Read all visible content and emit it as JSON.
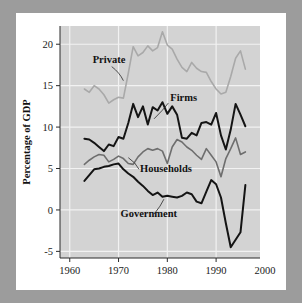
{
  "figure": {
    "background_color": "#ffffff",
    "page_color": "#9c9c9c",
    "plot_background_color": "#d3d3d3",
    "gridline_color": "#f2f2f2"
  },
  "chart_data": {
    "type": "line",
    "title": "",
    "subtitle": "",
    "xlabel": "",
    "ylabel": "Percentage of GDP",
    "xlim": [
      1958,
      1999
    ],
    "ylim": [
      -5.8,
      22.2
    ],
    "xticks": [
      1960,
      1970,
      1980,
      1990,
      2000
    ],
    "xtick_labels": [
      "1960",
      "1970",
      "1980",
      "1990",
      "2000"
    ],
    "yticks": [
      20,
      15,
      10,
      5,
      0,
      -5
    ],
    "ytick_labels": [
      "20",
      "15",
      "10",
      "5",
      "0",
      "-5"
    ],
    "grid": true,
    "grid_axes": "both",
    "legend": "inline-annotations",
    "legend_position": "in-plot leader-line labels",
    "series": [
      {
        "name": "Private",
        "color": "#a9a9a9",
        "line_width": 1.6,
        "label_text": "Private",
        "x": [
          1963,
          1964,
          1965,
          1966,
          1967,
          1968,
          1969,
          1970,
          1971,
          1972,
          1973,
          1974,
          1975,
          1976,
          1977,
          1978,
          1979,
          1980,
          1981,
          1982,
          1983,
          1984,
          1985,
          1986,
          1987,
          1988,
          1989,
          1990,
          1991,
          1992,
          1993,
          1994,
          1995,
          1996
        ],
        "values": [
          14.6,
          14.2,
          15.0,
          14.6,
          13.9,
          12.9,
          13.3,
          13.6,
          13.5,
          16.5,
          19.7,
          18.6,
          19.0,
          19.8,
          19.2,
          19.6,
          21.5,
          19.9,
          19.4,
          18.2,
          17.2,
          16.7,
          17.8,
          17.1,
          16.7,
          16.6,
          15.5,
          14.6,
          14.0,
          14.2,
          16.1,
          18.3,
          19.2,
          17.0
        ]
      },
      {
        "name": "Firms",
        "color": "#141414",
        "line_width": 2.0,
        "label_text": "Firms",
        "x": [
          1963,
          1964,
          1965,
          1966,
          1967,
          1968,
          1969,
          1970,
          1971,
          1972,
          1973,
          1974,
          1975,
          1976,
          1977,
          1978,
          1979,
          1980,
          1981,
          1982,
          1983,
          1984,
          1985,
          1986,
          1987,
          1988,
          1989,
          1990,
          1991,
          1992,
          1993,
          1994,
          1995,
          1996
        ],
        "values": [
          8.6,
          8.5,
          8.1,
          7.6,
          7.1,
          7.9,
          7.7,
          8.8,
          8.6,
          10.5,
          12.8,
          11.2,
          12.5,
          10.3,
          12.4,
          12.0,
          13.0,
          11.6,
          12.5,
          11.5,
          8.7,
          8.6,
          9.3,
          9.0,
          10.5,
          10.6,
          10.3,
          11.7,
          9.0,
          7.3,
          9.7,
          12.8,
          11.5,
          10.1
        ]
      },
      {
        "name": "Households",
        "color": "#6e6e6e",
        "line_width": 1.6,
        "label_text": "Households",
        "x": [
          1963,
          1964,
          1965,
          1966,
          1967,
          1968,
          1969,
          1970,
          1971,
          1972,
          1973,
          1974,
          1975,
          1976,
          1977,
          1978,
          1979,
          1980,
          1981,
          1982,
          1983,
          1984,
          1985,
          1986,
          1987,
          1988,
          1989,
          1990,
          1991,
          1992,
          1993,
          1994,
          1995,
          1996
        ],
        "values": [
          5.5,
          6.0,
          6.4,
          6.7,
          6.6,
          5.8,
          6.1,
          6.5,
          6.2,
          5.6,
          5.5,
          6.4,
          7.0,
          7.4,
          7.2,
          7.4,
          7.1,
          5.6,
          7.6,
          8.5,
          8.2,
          7.6,
          7.2,
          6.6,
          6.1,
          7.4,
          6.6,
          5.8,
          4.0,
          6.2,
          7.4,
          8.7,
          6.7,
          7.0
        ]
      },
      {
        "name": "Government",
        "color": "#141414",
        "line_width": 2.0,
        "label_text": "Government",
        "x": [
          1963,
          1964,
          1965,
          1966,
          1967,
          1968,
          1969,
          1970,
          1971,
          1972,
          1973,
          1974,
          1975,
          1976,
          1977,
          1978,
          1979,
          1980,
          1981,
          1982,
          1983,
          1984,
          1985,
          1986,
          1987,
          1988,
          1989,
          1990,
          1991,
          1992,
          1993,
          1994,
          1995,
          1996
        ],
        "values": [
          3.5,
          4.2,
          4.9,
          5.0,
          5.2,
          5.3,
          5.5,
          5.6,
          4.9,
          4.4,
          4.0,
          3.4,
          2.9,
          2.3,
          1.8,
          2.1,
          1.6,
          1.7,
          1.6,
          1.5,
          1.7,
          2.1,
          1.9,
          1.0,
          0.8,
          2.2,
          3.6,
          3.1,
          1.5,
          -1.6,
          -4.5,
          -3.6,
          -2.7,
          3.0
        ]
      }
    ],
    "annotations": [
      {
        "name": "Private",
        "text": "Private",
        "x": 1964.7,
        "y": 17.7,
        "anchor": "start"
      },
      {
        "name": "Firms",
        "text": "Firms",
        "x": 1980.6,
        "y": 13.1,
        "anchor": "start"
      },
      {
        "name": "Households",
        "text": "Households",
        "x": 1974.4,
        "y": 4.6,
        "anchor": "start"
      },
      {
        "name": "Government",
        "text": "Government",
        "x": 1970.4,
        "y": -0.9,
        "anchor": "start"
      }
    ]
  }
}
